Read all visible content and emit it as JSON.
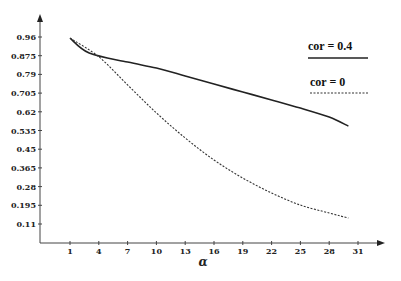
{
  "chart_data": {
    "type": "line",
    "title": "",
    "xlabel": "α",
    "ylabel": "",
    "x_ticks": [
      1,
      4,
      7,
      10,
      13,
      16,
      19,
      22,
      25,
      28,
      31
    ],
    "y_ticks": [
      0.96,
      0.875,
      0.79,
      0.705,
      0.62,
      0.535,
      0.45,
      0.365,
      0.28,
      0.195,
      0.11
    ],
    "y_tick_labels": [
      "0.96",
      "0.875",
      "0.79",
      "0.705",
      "0.62",
      "0.535",
      "0.45",
      "0.365",
      "0.28",
      "0.195",
      "0.11"
    ],
    "x_tick_labels": [
      "1",
      "4",
      "7",
      "10",
      "13",
      "16",
      "19",
      "22",
      "25",
      "28",
      "31"
    ],
    "xlim": [
      -2,
      34
    ],
    "ylim": [
      0.025,
      1.0
    ],
    "grid": false,
    "legend_position": "upper right",
    "series": [
      {
        "name": "cor = 0.4",
        "style": "solid",
        "x": [
          1,
          3,
          7,
          10,
          13,
          16,
          19,
          22,
          25,
          28,
          30
        ],
        "values": [
          0.955,
          0.887,
          0.846,
          0.819,
          0.783,
          0.746,
          0.71,
          0.674,
          0.637,
          0.596,
          0.555
        ]
      },
      {
        "name": "cor = 0",
        "style": "dashed",
        "x": [
          1,
          4,
          7,
          10,
          13,
          16,
          19,
          22,
          25,
          28,
          30
        ],
        "values": [
          0.955,
          0.87,
          0.742,
          0.615,
          0.501,
          0.401,
          0.319,
          0.251,
          0.196,
          0.16,
          0.137
        ]
      }
    ]
  },
  "legend": {
    "items": [
      {
        "label": "cor = 0.4",
        "style": "solid"
      },
      {
        "label": "cor = 0",
        "style": "dashed"
      }
    ]
  },
  "axes": {
    "x_label": "α"
  }
}
